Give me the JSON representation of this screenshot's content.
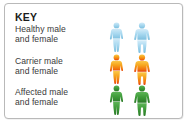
{
  "card": {
    "title": "KEY",
    "border_color": "#b9b9b9",
    "background_color": "#ffffff"
  },
  "legend": {
    "rows": [
      {
        "id": "healthy",
        "label_line1": "Healthy male",
        "label_line2": "and female",
        "color": "#a9d9f0",
        "color_dark": "#7bbede",
        "figures": [
          "female-figure",
          "male-figure"
        ]
      },
      {
        "id": "carrier",
        "label_line1": "Carrier male",
        "label_line2": "and female",
        "color": "#f6a41c",
        "color_dark": "#e8480f",
        "figures": [
          "female-figure",
          "male-figure"
        ]
      },
      {
        "id": "affected",
        "label_line1": "Affected male",
        "label_line2": "and female",
        "color": "#3f9c3a",
        "color_dark": "#2a7a27",
        "figures": [
          "female-figure",
          "male-figure"
        ]
      }
    ]
  },
  "text_color": "#3a3a3a",
  "title_color": "#1b1b1b"
}
